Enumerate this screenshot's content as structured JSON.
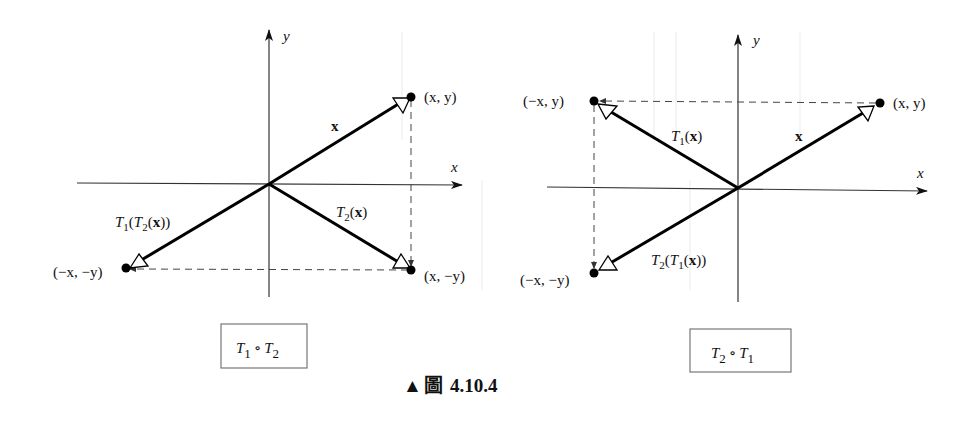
{
  "figure": {
    "caption_marker": "▲",
    "caption_label": "圖",
    "caption_number": "4.10.4"
  },
  "diagrams": [
    {
      "id": "left",
      "composition": {
        "t_a": "T",
        "sub_a": "1",
        "op": "∘",
        "t_b": "T",
        "sub_b": "2"
      },
      "axis_labels": {
        "x": "x",
        "y": "y"
      },
      "points": [
        {
          "name": "original",
          "label": "(x, y)"
        },
        {
          "name": "intermediate",
          "label": "(x, −y)"
        },
        {
          "name": "final",
          "label": "(−x, −y)"
        }
      ],
      "vectors": [
        {
          "name": "x",
          "label": "x"
        },
        {
          "name": "T2(x)",
          "label_main": "T",
          "label_sub": "2",
          "label_arg": "(x)"
        },
        {
          "name": "T1(T2(x))",
          "label_outer": "T",
          "label_outer_sub": "1",
          "label_inner": "T",
          "label_inner_sub": "2",
          "label_arg": "x"
        }
      ]
    },
    {
      "id": "right",
      "composition": {
        "t_a": "T",
        "sub_a": "2",
        "op": "∘",
        "t_b": "T",
        "sub_b": "1"
      },
      "axis_labels": {
        "x": "x",
        "y": "y"
      },
      "points": [
        {
          "name": "original",
          "label": "(x, y)"
        },
        {
          "name": "intermediate",
          "label": "(−x, y)"
        },
        {
          "name": "final",
          "label": "(−x, −y)"
        }
      ],
      "vectors": [
        {
          "name": "x",
          "label": "x"
        },
        {
          "name": "T1(x)",
          "label_main": "T",
          "label_sub": "1",
          "label_arg": "(x)"
        },
        {
          "name": "T2(T1(x))",
          "label_outer": "T",
          "label_outer_sub": "2",
          "label_inner": "T",
          "label_inner_sub": "1",
          "label_arg": "x"
        }
      ]
    }
  ]
}
